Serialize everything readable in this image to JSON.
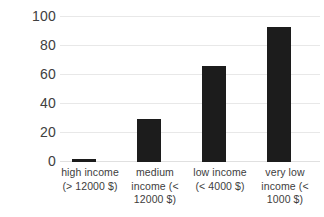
{
  "chart_data": {
    "type": "bar",
    "title": "",
    "xlabel": "",
    "ylabel": "",
    "categories": [
      "high income (> 12000 $)",
      "medium income  (< 12000 $)",
      "low income (< 4000 $)",
      "very low income  (< 1000 $)"
    ],
    "category_lines": [
      [
        "high income",
        "(> 12000 $)"
      ],
      [
        "medium",
        "income  (<",
        "12000 $)"
      ],
      [
        "low income",
        "(< 4000 $)"
      ],
      [
        "very low",
        "income  (<",
        "1000 $)"
      ]
    ],
    "values": [
      2,
      30,
      66,
      93
    ],
    "ylim": [
      0,
      100
    ],
    "yticks": [
      0,
      20,
      40,
      60,
      80,
      100
    ],
    "ytick_labels": [
      "0",
      "20",
      "40",
      "60",
      "80",
      "100"
    ],
    "grid": true,
    "legend": false,
    "legend_position": "none",
    "bar_color": "#1c1c1c",
    "gridline_color": "#e8e8e8",
    "background_color": "#ffffff"
  }
}
